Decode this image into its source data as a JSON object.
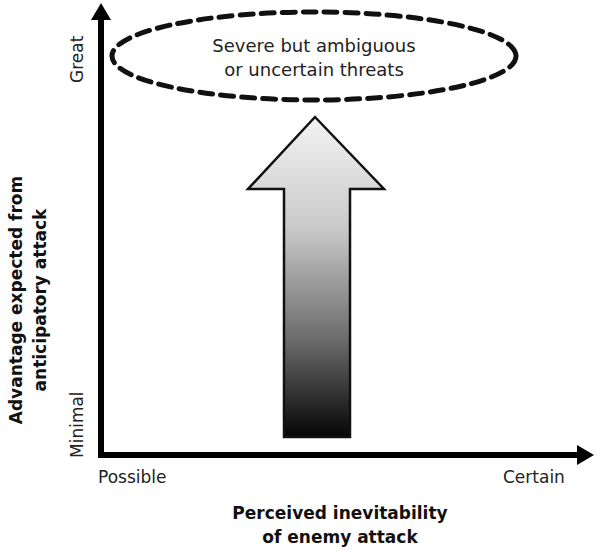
{
  "diagram": {
    "type": "conceptual-axis-diagram",
    "ellipse_label_line1": "Severe but ambiguous",
    "ellipse_label_line2": "or uncertain threats",
    "y_axis": {
      "title_line1": "Advantage expected from",
      "title_line2": "anticipatory attack",
      "low_label": "Minimal",
      "high_label": "Great"
    },
    "x_axis": {
      "title_line1": "Perceived inevitability",
      "title_line2": "of enemy attack",
      "low_label": "Possible",
      "high_label": "Certain"
    },
    "arrow": {
      "direction": "up",
      "gradient_top": "#f2f2f2",
      "gradient_bottom": "#050505"
    },
    "colors": {
      "axis": "#000000",
      "ellipse_stroke": "#111111",
      "background": "#ffffff"
    }
  }
}
